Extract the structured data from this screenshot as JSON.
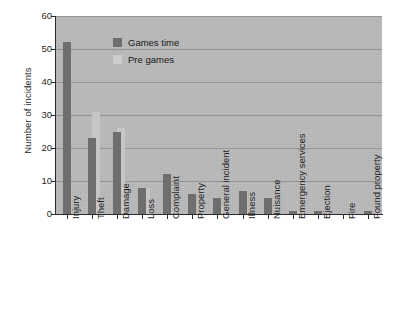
{
  "chart_data": {
    "type": "bar",
    "title": "",
    "xlabel": "",
    "ylabel": "Number of incidents",
    "ylim": [
      0,
      60
    ],
    "yticks": [
      0,
      10,
      20,
      30,
      40,
      50,
      60
    ],
    "grid": true,
    "legend_position": "upper-center",
    "categories": [
      "Injury",
      "Theft",
      "Damage",
      "Loss",
      "Complaint",
      "Property",
      "General incident",
      "Illness",
      "Nuisance",
      "Emergency services",
      "Ejection",
      "Fire",
      "Found property"
    ],
    "series": [
      {
        "name": "Games time",
        "color": "#6e6e6e",
        "values": [
          52,
          23,
          25,
          8,
          12,
          6,
          5,
          7,
          5,
          1,
          1,
          0,
          1
        ]
      },
      {
        "name": "Pre games",
        "color": "#cccccc",
        "values": [
          0,
          31,
          26,
          8,
          1,
          0,
          2,
          0,
          0,
          1,
          0,
          0,
          0
        ]
      }
    ]
  },
  "legend": {
    "items": [
      {
        "label": "Games time",
        "swatch": "dark-gray"
      },
      {
        "label": "Pre games",
        "swatch": "light-gray"
      }
    ]
  },
  "axes": {
    "y_title": "Number of incidents",
    "y_tick_labels": [
      "60",
      "50",
      "40",
      "30",
      "20",
      "10",
      "0"
    ]
  }
}
